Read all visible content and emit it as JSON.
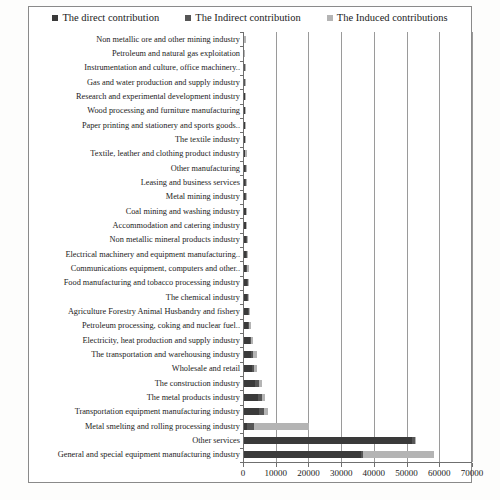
{
  "legend": {
    "position": "top-center",
    "items": [
      {
        "label": "The direct contribution",
        "color": "#3a3a3a",
        "icon": "square-marker-icon"
      },
      {
        "label": "The Indirect contribution",
        "color": "#565656",
        "icon": "square-marker-icon"
      },
      {
        "label": "The Induced contributions",
        "color": "#b4b4b4",
        "icon": "square-marker-icon"
      }
    ]
  },
  "chart_data": {
    "type": "bar",
    "orientation": "horizontal",
    "stacked": true,
    "title": "",
    "xlabel": "",
    "ylabel": "",
    "xlim": [
      0,
      70000
    ],
    "xticks": [
      0,
      10000,
      20000,
      30000,
      40000,
      50000,
      60000,
      70000
    ],
    "xticklabels": [
      "0",
      "10000",
      "20000",
      "30000",
      "40000",
      "50000",
      "60000",
      "70000"
    ],
    "grid": "vertical",
    "legend_position": "top-center",
    "categories": [
      "Non metallic ore and other mining industry",
      "Petroleum and natural gas exploitation",
      "Instrumentation and culture, office machinery..",
      "Gas and water production and supply industry",
      "Research and experimental development industry",
      "Wood processing and furniture manufacturing",
      "Paper printing and stationery and sports goods..",
      "The textile industry",
      "Textile, leather and clothing product industry",
      "Other manufacturing",
      "Leasing and business services",
      "Metal mining industry",
      "Coal mining and washing industry",
      "Accommodation and catering industry",
      "Non metallic mineral products industry",
      "Electrical machinery and equipment manufacturing..",
      "Communications equipment, computers and other..",
      "Food manufacturing and tobacco processing industry",
      "The chemical industry",
      "Agriculture Forestry Animal Husbandry and fishery",
      "Petroleum processing, coking and nuclear fuel..",
      "Electricity, heat production and supply industry",
      "The transportation and warehousing industry",
      "Wholesale and retail",
      "The construction industry",
      "The metal products industry",
      "Transportation equipment manufacturing industry",
      "Metal smelting and rolling processing industry",
      "Other services",
      "General and special equipment manufacturing industry"
    ],
    "series": [
      {
        "name": "The direct contribution",
        "color": "#3a3a3a",
        "values": [
          80,
          70,
          140,
          150,
          190,
          210,
          250,
          300,
          330,
          360,
          400,
          430,
          470,
          520,
          600,
          700,
          760,
          880,
          960,
          1080,
          1200,
          1700,
          2000,
          2400,
          3500,
          4200,
          4600,
          900,
          51500,
          35800
        ]
      },
      {
        "name": "The Indirect contribution",
        "color": "#565656",
        "values": [
          20,
          20,
          40,
          45,
          55,
          60,
          70,
          90,
          100,
          110,
          120,
          130,
          150,
          160,
          190,
          220,
          240,
          280,
          310,
          340,
          380,
          520,
          620,
          760,
          1100,
          1300,
          1450,
          2100,
          800,
          700
        ]
      },
      {
        "name": "The Induced contributions",
        "color": "#b4b4b4",
        "values": [
          15,
          15,
          30,
          35,
          40,
          45,
          55,
          70,
          80,
          90,
          95,
          105,
          120,
          130,
          150,
          180,
          380,
          220,
          250,
          270,
          700,
          420,
          1400,
          700,
          880,
          1000,
          1150,
          17000,
          300,
          21500
        ]
      }
    ]
  }
}
